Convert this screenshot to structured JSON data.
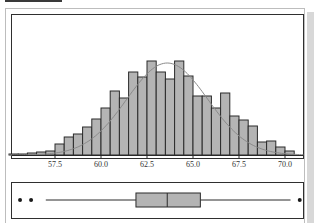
{
  "chart_data": [
    {
      "type": "bar",
      "subtype": "histogram",
      "title": "",
      "xlabel": "",
      "ylabel": "",
      "x_ticks": [
        57.5,
        60.0,
        62.5,
        65.0,
        67.5,
        70.0
      ],
      "x_tick_labels": [
        "57.5",
        "60.0",
        "62.5",
        "65.0",
        "67.5",
        "70.0"
      ],
      "xlim": [
        55.0,
        71.0
      ],
      "bin_width": 0.5,
      "bin_starts": [
        55.0,
        55.5,
        56.0,
        56.5,
        57.0,
        57.5,
        58.0,
        58.5,
        59.0,
        59.5,
        60.0,
        60.5,
        61.0,
        61.5,
        62.0,
        62.5,
        63.0,
        63.5,
        64.0,
        64.5,
        65.0,
        65.5,
        66.0,
        66.5,
        67.0,
        67.5,
        68.0,
        68.5,
        69.0,
        69.5,
        70.0
      ],
      "values": [
        1,
        1,
        2,
        3,
        4,
        11,
        18,
        21,
        28,
        36,
        47,
        64,
        57,
        83,
        78,
        94,
        83,
        76,
        94,
        79,
        59,
        59,
        47,
        62,
        39,
        35,
        29,
        13,
        14,
        8,
        4
      ],
      "overlay": {
        "type": "normal-curve",
        "mean": 63.6,
        "sd": 2.2,
        "peak": 92
      },
      "grid": false,
      "bar_color": "#b4b4b4",
      "edge_color": "#2a2a2a",
      "curve_color": "#8a8a8a"
    },
    {
      "type": "boxplot",
      "xlim": [
        55.0,
        71.0
      ],
      "whisker_low": 57.0,
      "q1": 61.9,
      "median": 63.6,
      "q3": 65.4,
      "whisker_high": 70.3,
      "outliers": [
        55.6,
        56.2,
        70.8
      ],
      "box_color": "#b4b4b4"
    }
  ]
}
